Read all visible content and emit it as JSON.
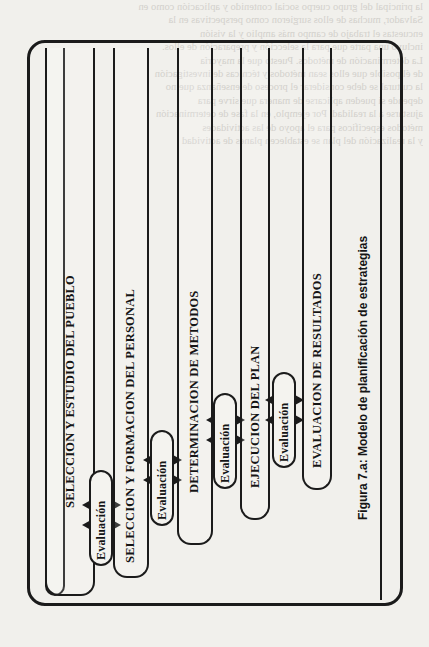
{
  "page": {
    "bleed_through_lines": [
      "la principal del grupo cuerpo social contenido y aplicación como en",
      "Salvador, muchas de ellos surgieron como perspectivas en la",
      "encuestas el trabajo de campo más amplio y la visión",
      "incluyó una parte que para la selección y preparación de ellos.",
      "La determinación de métodos. Puesto que la mayoría",
      "de él posible que ellos sean métodos y técnicas de investigación",
      "la cultural se debe considerar el proceso de enseñanza que no",
      "depende si pueden aplicarse de manera que sirve para",
      "ajustarse a la realidad. Por ejemplo, en la fase de determinación",
      "métodos específicos para el apoyo de las actividades",
      "y la realización del plan se establecen planes de actividad"
    ]
  },
  "figure": {
    "caption": "Figura 7.a: Modelo de planificación de estrategias",
    "stages": [
      {
        "id": 1,
        "label": "SELECCION Y ESTUDIO DEL PUEBLO"
      },
      {
        "id": 2,
        "label": "SELECCION Y FORMACION DEL PERSONAL"
      },
      {
        "id": 3,
        "label": "DETERMINACION DE METODOS"
      },
      {
        "id": 4,
        "label": "EJECUCION DEL PLAN"
      },
      {
        "id": 5,
        "label": "EVALUACION DE RESULTADOS"
      }
    ],
    "evaluations": [
      {
        "between": [
          1,
          2
        ],
        "label": "Evaluación"
      },
      {
        "between": [
          2,
          3
        ],
        "label": "Evaluación"
      },
      {
        "between": [
          3,
          4
        ],
        "label": "Evaluación"
      },
      {
        "between": [
          4,
          5
        ],
        "label": "Evaluación"
      }
    ],
    "colors": {
      "ink": "#1b1b1b",
      "paper": "#f1f0ec",
      "bleed": "#c9c7c2"
    }
  }
}
